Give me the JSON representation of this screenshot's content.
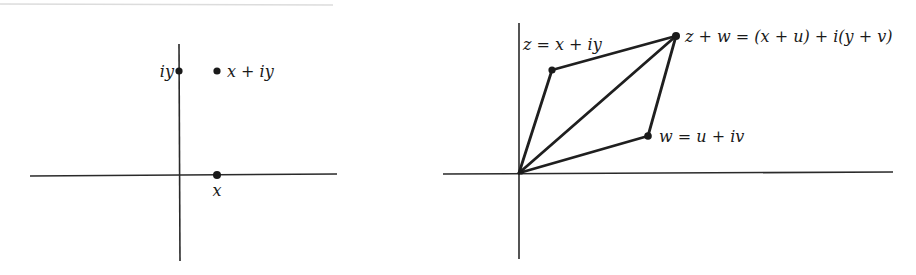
{
  "figure": {
    "left_panel": {
      "title": "Complex number as a point in the plane",
      "points": [
        {
          "id": "iy",
          "label": "iy",
          "x": 179,
          "y": 71
        },
        {
          "id": "x_plus_iy",
          "label": "x + iy",
          "x": 217,
          "y": 71
        },
        {
          "id": "x",
          "label": "x",
          "x": 217,
          "y": 175
        }
      ],
      "axes": {
        "horizontal": {
          "x1": 30,
          "x2": 337,
          "y": 175
        },
        "vertical": {
          "x": 179,
          "y1": 44,
          "y2": 261
        }
      }
    },
    "right_panel": {
      "title": "Parallelogram law for complex addition",
      "points": [
        {
          "id": "origin",
          "label": "",
          "x": 519,
          "y": 173
        },
        {
          "id": "z",
          "label": "z = x + iy",
          "x": 552,
          "y": 70
        },
        {
          "id": "z_plus_w",
          "label": "z + w = (x + u) + i(y + v)",
          "x": 676,
          "y": 36
        },
        {
          "id": "w",
          "label": "w = u + iv",
          "x": 648,
          "y": 136
        }
      ],
      "axes": {
        "horizontal": {
          "x1": 443,
          "x2": 893,
          "y": 173
        },
        "vertical": {
          "x": 519,
          "y1": 23,
          "y2": 259
        }
      }
    },
    "colors": {
      "ink": "#1a1a1a",
      "background": "#ffffff",
      "top_rule": "#d8d8d8"
    }
  }
}
